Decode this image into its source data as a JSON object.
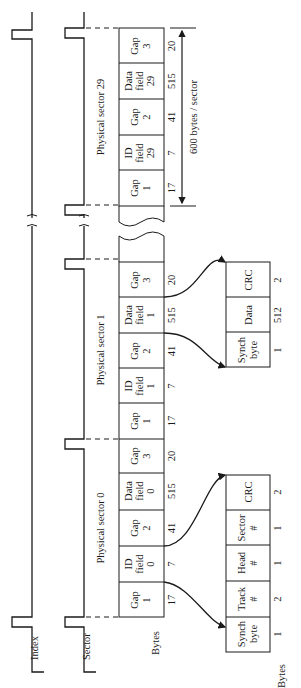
{
  "signals": {
    "index_label": "Index",
    "sector_label": "Sector"
  },
  "sectors": [
    {
      "label": "Physical sector 29",
      "fields": [
        {
          "name": "Gap",
          "sub": "1",
          "extra": "",
          "bytes": "17"
        },
        {
          "name": "ID",
          "sub": "field",
          "extra": "29",
          "bytes": "7"
        },
        {
          "name": "Gap",
          "sub": "2",
          "extra": "",
          "bytes": "41"
        },
        {
          "name": "Data",
          "sub": "field",
          "extra": "29",
          "bytes": "515"
        },
        {
          "name": "Gap",
          "sub": "3",
          "extra": "",
          "bytes": "20"
        }
      ]
    },
    {
      "label": "Physical sector 1",
      "fields": [
        {
          "name": "Gap",
          "sub": "1",
          "extra": "",
          "bytes": "17"
        },
        {
          "name": "ID",
          "sub": "field",
          "extra": "1",
          "bytes": "7"
        },
        {
          "name": "Gap",
          "sub": "2",
          "extra": "",
          "bytes": "41"
        },
        {
          "name": "Data",
          "sub": "field",
          "extra": "1",
          "bytes": "515"
        },
        {
          "name": "Gap",
          "sub": "3",
          "extra": "",
          "bytes": "20"
        }
      ]
    },
    {
      "label": "Physical sector 0",
      "fields": [
        {
          "name": "Gap",
          "sub": "1",
          "extra": "",
          "bytes": "17"
        },
        {
          "name": "ID",
          "sub": "field",
          "extra": "0",
          "bytes": "7"
        },
        {
          "name": "Gap",
          "sub": "2",
          "extra": "",
          "bytes": "41"
        },
        {
          "name": "Data",
          "sub": "field",
          "extra": "0",
          "bytes": "515"
        },
        {
          "name": "Gap",
          "sub": "3",
          "extra": "",
          "bytes": "20"
        }
      ]
    }
  ],
  "sector_size_label": "600 bytes / sector",
  "bytes_label": "Bytes",
  "data_field_detail": {
    "cells": [
      {
        "line1": "Synch",
        "line2": "byte",
        "bytes": "1"
      },
      {
        "line1": "Data",
        "line2": "",
        "bytes": "512"
      },
      {
        "line1": "CRC",
        "line2": "",
        "bytes": "2"
      }
    ]
  },
  "id_field_detail": {
    "cells": [
      {
        "line1": "Synch",
        "line2": "byte",
        "bytes": "1"
      },
      {
        "line1": "Track",
        "line2": "#",
        "bytes": "2"
      },
      {
        "line1": "Head",
        "line2": "#",
        "bytes": "1"
      },
      {
        "line1": "Sector",
        "line2": "#",
        "bytes": "1"
      },
      {
        "line1": "CRC",
        "line2": "",
        "bytes": "2"
      }
    ],
    "bytes_label": "Bytes"
  }
}
